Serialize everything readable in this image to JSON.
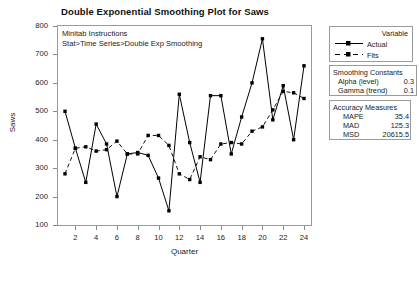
{
  "title": "Double Exponential Smoothing Plot for Saws",
  "annotation": {
    "line1": "Minitab Instructions",
    "line2": "Stat>Time Series>Double Exp Smoothing"
  },
  "legend": {
    "heading": "Variable",
    "items": [
      {
        "label": "Actual",
        "style": "solid-line-square-marker",
        "color": "#000000"
      },
      {
        "label": "Fits",
        "style": "dashed-line-square-marker",
        "color": "#000000"
      }
    ]
  },
  "smoothing_constants": {
    "heading": "Smoothing Constants",
    "rows": [
      {
        "name": "Alpha (level)",
        "value": "0.3"
      },
      {
        "name": "Gamma (trend)",
        "value": "0.1"
      }
    ]
  },
  "accuracy_measures": {
    "heading": "Accuracy Measures",
    "rows": [
      {
        "name": "MAPE",
        "value": "35.4"
      },
      {
        "name": "MAD",
        "value": "125.3"
      },
      {
        "name": "MSD",
        "value": "20615.5"
      }
    ]
  },
  "chart_data": {
    "type": "line",
    "title": "Double Exponential Smoothing Plot for Saws",
    "xlabel": "Quarter",
    "ylabel": "Saws",
    "xlim": [
      1,
      24
    ],
    "ylim": [
      100,
      800
    ],
    "yticks": [
      100,
      200,
      300,
      400,
      500,
      600,
      700,
      800
    ],
    "xticks": [
      2,
      4,
      6,
      8,
      10,
      12,
      14,
      16,
      18,
      20,
      22,
      24
    ],
    "grid": false,
    "legend_position": "right-top",
    "x": [
      1,
      2,
      3,
      4,
      5,
      6,
      7,
      8,
      9,
      10,
      11,
      12,
      13,
      14,
      15,
      16,
      17,
      18,
      19,
      20,
      21,
      22,
      23,
      24
    ],
    "series": [
      {
        "name": "Actual",
        "line": "solid",
        "marker": "square",
        "values": [
          500,
          370,
          250,
          455,
          385,
          200,
          350,
          355,
          345,
          265,
          150,
          560,
          390,
          250,
          555,
          555,
          350,
          480,
          600,
          755,
          470,
          590,
          400,
          660
        ]
      },
      {
        "name": "Fits",
        "line": "dashed",
        "marker": "square",
        "values": [
          280,
          370,
          375,
          360,
          365,
          395,
          350,
          350,
          415,
          415,
          380,
          280,
          260,
          340,
          330,
          385,
          390,
          385,
          430,
          445,
          505,
          570,
          565,
          545
        ]
      }
    ]
  }
}
